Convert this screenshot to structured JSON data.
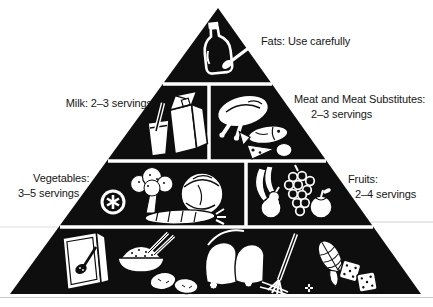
{
  "diagram": {
    "type": "food-guide-pyramid",
    "colors": {
      "ink": "#0e0e0e",
      "paper": "#ffffff",
      "scan_line": "#c9c9c9"
    },
    "labels": {
      "fats": "Fats: Use carefully",
      "milk": "Milk: 2–3 servings",
      "meat_line1": "Meat and Meat Substitutes:",
      "meat_line2": "2–3 servings",
      "vegetables_line1": "Vegetables:",
      "vegetables_line2": "3–5 servings",
      "fruits_line1": "Fruits:",
      "fruits_line2": "2–4 servings"
    },
    "sections": [
      {
        "id": "fats",
        "level": 1,
        "icons": [
          "oil-bottle-icon",
          "butter-knife-icon"
        ]
      },
      {
        "id": "milk",
        "level": 2,
        "icons": [
          "milk-carton-icon",
          "drinking-glass-icon",
          "straw-icon"
        ]
      },
      {
        "id": "meat-and-meat-substitutes",
        "level": 2,
        "icons": [
          "poultry-icon",
          "fish-icon",
          "cheese-wedge-icon",
          "egg-icon"
        ]
      },
      {
        "id": "vegetables",
        "level": 3,
        "icons": [
          "tomato-slice-icon",
          "broccoli-icon",
          "cabbage-icon",
          "carrot-icon"
        ]
      },
      {
        "id": "fruits",
        "level": 3,
        "icons": [
          "banana-icon",
          "pear-icon",
          "grapes-icon",
          "apple-icon"
        ]
      },
      {
        "id": "base-level",
        "level": 4,
        "icons": [
          "cereal-box-icon",
          "spoon-icon",
          "cereal-bowl-icon",
          "pasta-sticks-icon",
          "potatoes-icon",
          "bread-slices-icon",
          "fork-and-spaghetti-icon",
          "sparkle-icon",
          "corn-cob-icon",
          "crackers-icon"
        ]
      }
    ]
  }
}
